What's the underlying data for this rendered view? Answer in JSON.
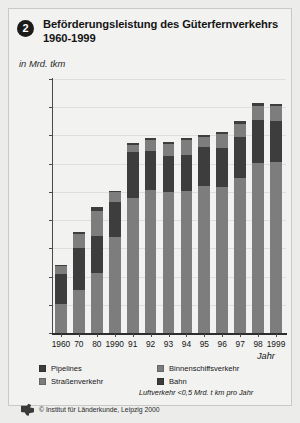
{
  "header": {
    "badge": "2",
    "title": "Beförderungsleistung des Güterfernverkehrs 1960-1999",
    "subtitle": "in Mrd. tkm"
  },
  "footer": {
    "logo_icon": "institute-logo-icon",
    "copyright": "© Institut für Länderkunde, Leipzig 2000"
  },
  "colors": {
    "strassenverkehr": "#7d7d7d",
    "bahn": "#3d3d3d",
    "binnenschiffsverkehr": "#7d7d7d",
    "pipelines": "#3d3d3d",
    "axis": "#2e2e2e",
    "grid": "#dedede",
    "card_bg": "#f2f2f1",
    "page_bg": "#ececeb"
  },
  "legend": {
    "items": [
      {
        "label": "Pipelines",
        "color": "#3d3d3d"
      },
      {
        "label": "Binnenschiffsverkehr",
        "color": "#7d7d7d"
      },
      {
        "label": "Straßenverkehr",
        "color": "#7d7d7d"
      },
      {
        "label": "Bahn",
        "color": "#3d3d3d"
      }
    ],
    "note": "Luftverkehr <0,5 Mrd. t km pro Jahr"
  },
  "chart_data": {
    "type": "bar",
    "stacked": true,
    "title": "Beförderungsleistung des Güterfernverkehrs 1960-1999",
    "subtitle": "in Mrd. tkm",
    "xlabel": "Jahr",
    "ylabel": "in Mrd. tkm",
    "ylim": [
      0,
      450
    ],
    "ytick_step": 50,
    "yticks": [
      0,
      50,
      100,
      150,
      200,
      250,
      300,
      350,
      400,
      450
    ],
    "grid": true,
    "legend_position": "below-axis",
    "categories": [
      "1960",
      "70",
      "80",
      "1990",
      "91",
      "92",
      "93",
      "94",
      "95",
      "96",
      "97",
      "98",
      "1999"
    ],
    "series": [
      {
        "name": "Straßenverkehr",
        "color": "#7d7d7d",
        "values": [
          52,
          77,
          107,
          170,
          239,
          253,
          250,
          251,
          261,
          258,
          275,
          302,
          303
        ]
      },
      {
        "name": "Bahn",
        "color": "#3d3d3d",
        "values": [
          53,
          74,
          65,
          62,
          82,
          70,
          63,
          65,
          68,
          70,
          73,
          75,
          72
        ]
      },
      {
        "name": "Binnenschiffsverkehr",
        "color": "#7d7d7d",
        "values": [
          13,
          24,
          44,
          18,
          12,
          19,
          22,
          26,
          19,
          24,
          23,
          26,
          27
        ]
      },
      {
        "name": "Pipelines",
        "color": "#3d3d3d",
        "values": [
          2,
          4,
          7,
          1,
          4,
          3,
          3,
          3,
          3,
          4,
          4,
          4,
          4
        ]
      }
    ],
    "totals": [
      120,
      179,
      223,
      251,
      337,
      345,
      338,
      345,
      351,
      356,
      375,
      407,
      406
    ],
    "note": "Luftverkehr <0,5 Mrd. t km pro Jahr"
  }
}
